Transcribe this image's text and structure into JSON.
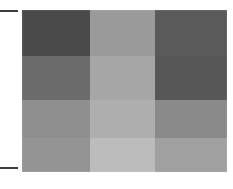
{
  "figure": {
    "background_color": "#ffffff",
    "axis_tick_color": "#3c3c3c",
    "ticks": [
      {
        "name": "top-tick",
        "y": 10
      },
      {
        "name": "bottom-tick",
        "y": 167
      }
    ]
  },
  "chart_data": {
    "type": "heatmap",
    "title": "",
    "subtitle": "",
    "xlabel": "",
    "ylabel": "",
    "grid": false,
    "legend": "none",
    "colormap": "grayscale",
    "columns": 3,
    "rows": 4,
    "x_tick_labels": [],
    "y_tick_labels": [],
    "column_widths_px": [
      68,
      65,
      72
    ],
    "row_heights_px": [
      46,
      44,
      38,
      34
    ],
    "cell_colors": [
      [
        "#4a4a4a",
        "#9a9a9a",
        "#5a5a5a"
      ],
      [
        "#6b6b6b",
        "#a6a6a6",
        "#575757"
      ],
      [
        "#8f8f8f",
        "#aeaeae",
        "#8a8a8a"
      ],
      [
        "#949494",
        "#bcbcbc",
        "#a0a0a0"
      ]
    ],
    "values": [
      [
        74,
        154,
        90
      ],
      [
        107,
        166,
        87
      ],
      [
        143,
        174,
        138
      ],
      [
        148,
        188,
        160
      ]
    ],
    "value_range": [
      74,
      188
    ]
  }
}
